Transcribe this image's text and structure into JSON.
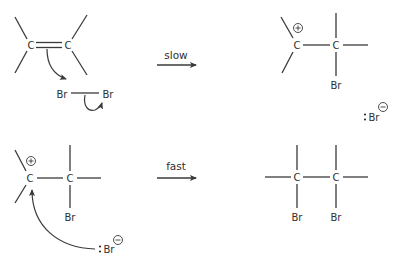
{
  "diagram": {
    "step1": {
      "reactant_atoms": {
        "c_left": "C",
        "c_right": "C"
      },
      "bromine": {
        "br_left": "Br",
        "br_right": "Br"
      },
      "arrow_label": "slow",
      "product_atoms": {
        "c_cation": "C",
        "c_right": "C",
        "br": "Br"
      },
      "cation_charge": "+",
      "bromide": {
        "label": "Br",
        "charge": "−"
      }
    },
    "step2": {
      "reactant_atoms": {
        "c_cation": "C",
        "c_right": "C",
        "br": "Br"
      },
      "cation_charge": "+",
      "bromide": {
        "label": "Br",
        "charge": "−"
      },
      "arrow_label": "fast",
      "product_atoms": {
        "c_left": "C",
        "c_right": "C",
        "br_left": "Br",
        "br_right": "Br"
      }
    },
    "colors": {
      "ink": "#3a3a3a",
      "background": "#ffffff"
    }
  }
}
